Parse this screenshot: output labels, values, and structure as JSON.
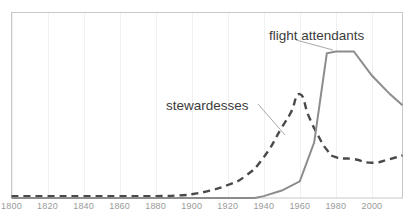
{
  "chart_data": {
    "type": "line",
    "title": "",
    "subtitle": "",
    "xlabel": "",
    "ylabel": "",
    "xlim": [
      1800,
      2017
    ],
    "ylim": [
      0,
      100
    ],
    "grid": "vertical-only",
    "legend_position": "inline-annotations",
    "xticks": [
      1800,
      1820,
      1840,
      1860,
      1880,
      1900,
      1920,
      1940,
      1960,
      1980,
      2000
    ],
    "xtick_labels": [
      "1800",
      "1820",
      "1840",
      "1860",
      "1880",
      "1900",
      "1920",
      "1940",
      "1960",
      "1980",
      "2000"
    ],
    "yticks": [],
    "ytick_labels": [],
    "series": [
      {
        "name": "stewardesses",
        "style": "dashed",
        "color": "#4a4a4a",
        "x": [
          1800,
          1820,
          1840,
          1860,
          1880,
          1895,
          1900,
          1910,
          1920,
          1930,
          1940,
          1950,
          1955,
          1960,
          1965,
          1970,
          1975,
          1980,
          1990,
          2000,
          2010,
          2017
        ],
        "values": [
          1,
          1,
          1,
          1,
          1,
          1.5,
          2,
          4,
          7,
          12,
          22,
          38,
          46,
          56,
          44,
          34,
          26,
          22,
          21,
          19,
          21,
          23
        ]
      },
      {
        "name": "flight attendants",
        "style": "solid",
        "color": "#8c8c8c",
        "x": [
          1800,
          1820,
          1840,
          1860,
          1880,
          1900,
          1920,
          1935,
          1940,
          1950,
          1960,
          1968,
          1975,
          1980,
          1985,
          1990,
          2000,
          2010,
          2017
        ],
        "values": [
          0,
          0,
          0,
          0,
          0,
          0,
          0,
          0,
          1,
          4,
          9,
          30,
          78,
          79,
          79,
          79,
          66,
          56,
          50
        ]
      }
    ],
    "annotations": [
      {
        "text": "stewardesses",
        "target_series": "stewardesses",
        "label_x": 166,
        "label_y": 98,
        "leader_from": [
          258,
          104
        ],
        "leader_to": [
          285,
          135
        ]
      },
      {
        "text": "flight attendants",
        "target_series": "flight attendants",
        "label_x": 269,
        "label_y": 28,
        "leader_from": [
          296,
          40
        ],
        "leader_to": [
          333,
          50
        ]
      }
    ],
    "colors": {
      "stewardesses_line": "#4a4a4a",
      "flight_attendants_line": "#8c8c8c",
      "plot_border": "#c8c8c8",
      "gridline": "#f0f0f0",
      "tick_text": "#9a9a9a",
      "annotation_text": "#3c3c3c",
      "leader_line": "#a8a8a8",
      "background": "#ffffff"
    }
  }
}
